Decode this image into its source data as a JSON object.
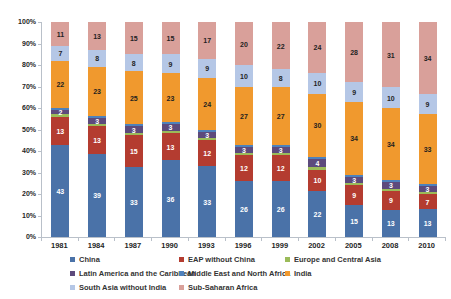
{
  "chart_data": {
    "type": "bar",
    "subtype": "stacked-100-percent",
    "title": "",
    "xlabel": "",
    "ylabel": "",
    "ylim": [
      0,
      100
    ],
    "grid": false,
    "legend_position": "bottom",
    "background_color": "#ffffff",
    "axis_color": "#b9c0c9",
    "tick_label_color": "#262626",
    "categories": [
      "1981",
      "1984",
      "1987",
      "1990",
      "1993",
      "1996",
      "1999",
      "2002",
      "2005",
      "2008",
      "2010"
    ],
    "yticks": [
      "0%",
      "10%",
      "20%",
      "30%",
      "40%",
      "50%",
      "60%",
      "70%",
      "80%",
      "90%",
      "100%"
    ],
    "series": [
      {
        "name": "China",
        "color": "#4A72A8",
        "label_color": "#ffffff",
        "show_labels": true,
        "values": [
          43,
          39,
          33,
          36,
          33,
          26,
          26,
          22,
          15,
          13,
          13
        ]
      },
      {
        "name": "EAP without China",
        "color": "#B43C30",
        "label_color": "#ffffff",
        "show_labels": true,
        "values": [
          13,
          13,
          15,
          13,
          12,
          12,
          12,
          10,
          9,
          9,
          7
        ]
      },
      {
        "name": "Europe and Central Asia",
        "color": "#9BBB59",
        "label_color": "#ffffff",
        "show_labels": false,
        "values": [
          1,
          1,
          1,
          1,
          1,
          1,
          1,
          1,
          1,
          1,
          1
        ]
      },
      {
        "name": "Latin America and the Caribbean",
        "color": "#5D4A7C",
        "label_color": "#ffffff",
        "show_labels": true,
        "values": [
          2,
          3,
          3,
          3,
          3,
          3,
          3,
          4,
          3,
          3,
          3
        ]
      },
      {
        "name": "Middle East and North Africa",
        "color": "#4E81BC",
        "label_color": "#ffffff",
        "show_labels": false,
        "values": [
          1,
          1,
          1,
          1,
          1,
          1,
          1,
          1,
          1,
          1,
          1
        ]
      },
      {
        "name": "India",
        "color": "#F0992E",
        "label_color": "#1f1f1f",
        "show_labels": true,
        "values": [
          22,
          23,
          25,
          23,
          24,
          27,
          27,
          30,
          34,
          34,
          33
        ]
      },
      {
        "name": "South Asia without India",
        "color": "#B5C7E6",
        "label_color": "#1f1f1f",
        "show_labels": true,
        "values": [
          7,
          8,
          8,
          9,
          9,
          10,
          8,
          10,
          9,
          10,
          9
        ]
      },
      {
        "name": "Sub-Saharan Africa",
        "color": "#D9A09A",
        "label_color": "#1f1f1f",
        "show_labels": true,
        "values": [
          11,
          13,
          15,
          15,
          17,
          20,
          22,
          24,
          28,
          31,
          34
        ]
      }
    ],
    "legend_items": [
      "China",
      "EAP without China",
      "Europe and Central Asia",
      "Latin America and the Caribbean",
      "Middle East and North Africa",
      "India",
      "South Asia without India",
      "Sub-Saharan Africa"
    ]
  }
}
